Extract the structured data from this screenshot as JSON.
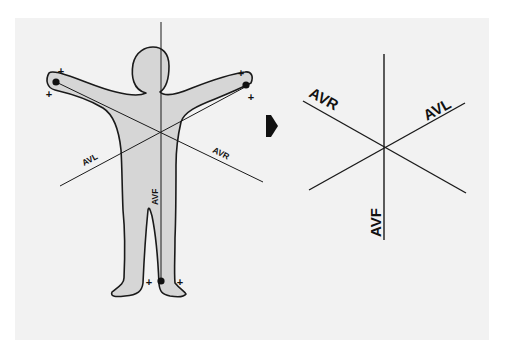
{
  "figure": {
    "left_diagram": {
      "description": "Human figure with augmented limb leads electrode positions",
      "labels": {
        "avl": "AVL",
        "avr": "AVR",
        "avf": "AVF"
      },
      "electrodes": [
        {
          "name": "right-arm",
          "polarity_marks": [
            "+",
            "+"
          ]
        },
        {
          "name": "left-arm",
          "polarity_marks": [
            "+",
            "+"
          ]
        },
        {
          "name": "left-leg",
          "polarity_marks": [
            "+",
            "+"
          ]
        }
      ],
      "plus_sign": "+"
    },
    "arrow": {
      "icon": "right-arrow-icon"
    },
    "right_diagram": {
      "description": "Hexaxial reference axes for augmented leads",
      "labels": {
        "avr": "AVR",
        "avl": "AVL",
        "avf": "AVF"
      }
    },
    "colors": {
      "panel": "#f2f2f2",
      "body_fill": "#d6d6d6",
      "stroke": "#1a1a1a"
    }
  }
}
